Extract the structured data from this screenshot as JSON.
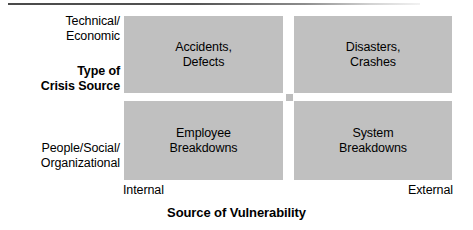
{
  "figure": {
    "title_rule_visible": true,
    "background_color": "#ffffff",
    "cell_fill_color": "#c0c0c0",
    "text_color": "#000000"
  },
  "chart_data": {
    "type": "table",
    "title": "",
    "xlabel": "Source of Vulnerability",
    "ylabel": "Type of Crisis Source",
    "x_categories": [
      "Internal",
      "External"
    ],
    "y_categories": [
      "Technical/\nEconomic",
      "People/Social/\nOrganizational"
    ],
    "cells": [
      {
        "row": 0,
        "col": 0,
        "label": "Accidents,\nDefects"
      },
      {
        "row": 0,
        "col": 1,
        "label": "Disasters,\nCrashes"
      },
      {
        "row": 1,
        "col": 0,
        "label": "Employee\nBreakdowns"
      },
      {
        "row": 1,
        "col": 1,
        "label": "System\nBreakdowns"
      }
    ]
  },
  "matrix": {
    "top_left": "Accidents,\nDefects",
    "top_right": "Disasters,\nCrashes",
    "bottom_left": "Employee\nBreakdowns",
    "bottom_right": "System\nBreakdowns"
  },
  "y_axis": {
    "title": "Type of\nCrisis Source",
    "label_top": "Technical/\nEconomic",
    "label_bottom": "People/Social/\nOrganizational"
  },
  "x_axis": {
    "title": "Source of Vulnerability",
    "label_left": "Internal",
    "label_right": "External"
  }
}
